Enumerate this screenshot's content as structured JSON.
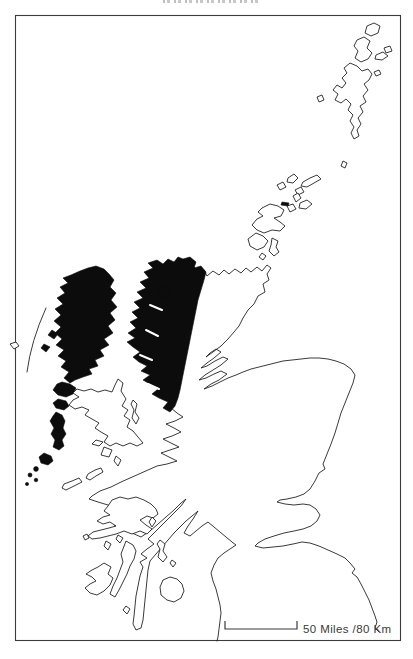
{
  "map": {
    "scale_bar": {
      "label": "50 Miles /80 Km"
    },
    "colors": {
      "background": "#ffffff",
      "coastline": "#242424",
      "highlight_fill": "#0c0c0c",
      "frame": "#3c3c3c",
      "scale_text": "#3a3a3a"
    }
  }
}
